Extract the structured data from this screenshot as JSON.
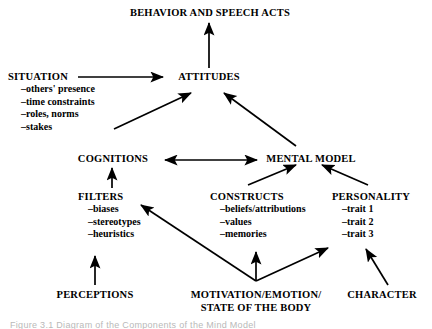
{
  "figure": {
    "type": "flow-diagram",
    "background_color": "#ffffff",
    "ink_color": "#000000",
    "caption": "Figure 3.1   Diagram of the Components of the Mind Model"
  },
  "nodes": {
    "behavior": {
      "label": "BEHAVIOR AND SPEECH ACTS"
    },
    "situation": {
      "label": "SITUATION",
      "items": [
        "–others' presence",
        "–time constraints",
        "–roles, norms",
        "–stakes"
      ]
    },
    "attitudes": {
      "label": "ATTITUDES"
    },
    "cognitions": {
      "label": "COGNITIONS"
    },
    "mental_model": {
      "label": "MENTAL MODEL"
    },
    "filters": {
      "label": "FILTERS",
      "items": [
        "–biases",
        "–stereotypes",
        "–heuristics"
      ]
    },
    "constructs": {
      "label": "CONSTRUCTS",
      "items": [
        "–beliefs/attributions",
        "–values",
        "–memories"
      ]
    },
    "personality": {
      "label": "PERSONALITY",
      "items": [
        "–trait 1",
        "–trait 2",
        "–trait 3"
      ]
    },
    "perceptions": {
      "label": "PERCEPTIONS"
    },
    "motivation": {
      "line1": "MOTIVATION/EMOTION/",
      "line2": "STATE OF THE BODY"
    },
    "character": {
      "label": "CHARACTER"
    }
  },
  "edges": [
    {
      "from": "attitudes",
      "to": "behavior",
      "style": "single"
    },
    {
      "from": "situation",
      "to": "attitudes",
      "style": "single"
    },
    {
      "from": "situation-list",
      "to": "attitudes",
      "style": "single"
    },
    {
      "from": "mental_model",
      "to": "attitudes",
      "style": "single"
    },
    {
      "from": "cognitions",
      "to": "mental_model",
      "style": "double"
    },
    {
      "from": "filters",
      "to": "cognitions",
      "style": "single"
    },
    {
      "from": "constructs",
      "to": "mental_model",
      "style": "single"
    },
    {
      "from": "personality",
      "to": "mental_model",
      "style": "single"
    },
    {
      "from": "perceptions",
      "to": "filters",
      "style": "single"
    },
    {
      "from": "motivation",
      "to": "constructs-memories",
      "style": "single"
    },
    {
      "from": "motivation",
      "to": "filters",
      "style": "single"
    },
    {
      "from": "motivation",
      "to": "personality-trait3",
      "style": "single"
    },
    {
      "from": "character",
      "to": "personality-trait3",
      "style": "single"
    }
  ]
}
